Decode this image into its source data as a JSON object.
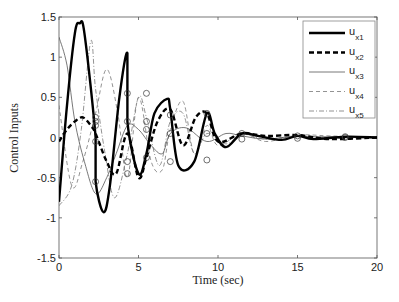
{
  "chart_data": {
    "type": "line",
    "title": "",
    "xlabel": "Time (sec)",
    "ylabel": "Control Inputs",
    "xlim": [
      0,
      20
    ],
    "ylim": [
      -1.5,
      1.5
    ],
    "xticks": [
      0,
      5,
      10,
      15,
      20
    ],
    "yticks": [
      -1.5,
      -1,
      -0.5,
      0,
      0.5,
      1,
      1.5
    ],
    "xtick_labels": [
      "0",
      "5",
      "10",
      "15",
      "20"
    ],
    "ytick_labels": [
      "-1.5",
      "-1",
      "-0.5",
      "0",
      "0.5",
      "1",
      "1.5"
    ],
    "grid": false,
    "legend_position": "upper right",
    "switch_times": [
      2.3,
      4.3,
      5.5,
      7.0,
      9.3,
      11.5,
      15.0,
      18.0
    ],
    "series": [
      {
        "name": "u_x1",
        "label_main": "u",
        "label_sub": "x1",
        "style": "solid-thick",
        "x": [
          0,
          0.5,
          1.0,
          1.3,
          1.6,
          2.3,
          2.3,
          2.8,
          3.2,
          3.8,
          4.3,
          4.3,
          5.0,
          5.5,
          6.0,
          6.8,
          7.0,
          7.5,
          8.5,
          9.3,
          9.8,
          10.5,
          11.5,
          12.5,
          14,
          15,
          16,
          18,
          20
        ],
        "y": [
          -0.8,
          0.4,
          1.3,
          1.42,
          1.3,
          0.0,
          -0.55,
          -0.93,
          -0.6,
          0.5,
          1.05,
          0.2,
          -0.45,
          -0.2,
          0.3,
          0.48,
          0.35,
          -0.35,
          -0.3,
          0.3,
          0.05,
          -0.12,
          0.05,
          0.02,
          -0.03,
          0.02,
          -0.02,
          0.01,
          0.0
        ]
      },
      {
        "name": "u_x2",
        "label_main": "u",
        "label_sub": "x2",
        "style": "dashed-thick",
        "x": [
          0,
          0.5,
          1.0,
          1.5,
          2.0,
          2.3,
          3.0,
          3.6,
          4.3,
          5.0,
          5.5,
          6.2,
          7.0,
          7.8,
          8.6,
          9.3,
          10,
          11.5,
          13,
          15,
          17,
          20
        ],
        "y": [
          -0.05,
          0.1,
          0.2,
          0.25,
          0.15,
          0.05,
          -0.3,
          -0.45,
          0.05,
          -0.5,
          -0.25,
          0.2,
          0.35,
          -0.1,
          0.25,
          0.3,
          -0.05,
          0.05,
          0.02,
          0.03,
          -0.02,
          0.0
        ]
      },
      {
        "name": "u_x3",
        "label_main": "u",
        "label_sub": "x3",
        "style": "solid-thin",
        "x": [
          0,
          0.5,
          1.0,
          1.6,
          2.3,
          3.0,
          3.6,
          4.3,
          5.0,
          5.8,
          6.5,
          7.0,
          8.0,
          9.3,
          10.5,
          11.5,
          13,
          15,
          20
        ],
        "y": [
          1.25,
          0.9,
          0.2,
          -0.3,
          -0.7,
          -0.5,
          -0.2,
          0.15,
          0.1,
          -0.1,
          -0.2,
          0.05,
          0.12,
          -0.05,
          0.05,
          0.02,
          -0.02,
          0.01,
          0.0
        ]
      },
      {
        "name": "u_x4",
        "label_main": "u",
        "label_sub": "x4",
        "style": "dashed-thin",
        "x": [
          0,
          0.8,
          1.5,
          2.3,
          3.0,
          3.7,
          4.3,
          5.0,
          5.8,
          6.5,
          7.0,
          7.8,
          8.5,
          9.3,
          10,
          11.5,
          13,
          15,
          17,
          20
        ],
        "y": [
          0.4,
          -0.6,
          -0.3,
          0.3,
          0.85,
          0.3,
          -0.5,
          0.5,
          -0.3,
          -0.4,
          0.1,
          0.45,
          -0.2,
          0.15,
          -0.1,
          0.05,
          -0.05,
          0.03,
          0.02,
          0.0
        ]
      },
      {
        "name": "u_x5",
        "label_main": "u",
        "label_sub": "x5",
        "style": "dashdot-thin",
        "x": [
          0,
          0.8,
          1.4,
          2.0,
          2.3,
          2.9,
          3.5,
          4.3,
          5.0,
          5.5,
          6.3,
          7.0,
          7.8,
          8.5,
          9.3,
          10.5,
          11.5,
          13,
          15,
          17,
          20
        ],
        "y": [
          -0.85,
          -0.6,
          0.1,
          1.2,
          0.6,
          -0.2,
          -0.75,
          -0.2,
          0.5,
          0.25,
          -0.35,
          0.2,
          0.3,
          -0.2,
          0.05,
          -0.08,
          0.04,
          -0.02,
          0.02,
          -0.01,
          0.0
        ]
      }
    ],
    "markers": {
      "shape": "circle",
      "points": [
        [
          2.3,
          0.25
        ],
        [
          2.3,
          0.2
        ],
        [
          2.3,
          0.15
        ],
        [
          2.3,
          -0.05
        ],
        [
          2.3,
          -0.55
        ],
        [
          4.3,
          0.55
        ],
        [
          4.3,
          0.2
        ],
        [
          4.3,
          -0.3
        ],
        [
          4.3,
          -0.45
        ],
        [
          5.5,
          0.55
        ],
        [
          5.5,
          0.2
        ],
        [
          5.5,
          -0.25
        ],
        [
          5.5,
          0.1
        ],
        [
          7.0,
          0.28
        ],
        [
          7.0,
          -0.3
        ],
        [
          7.0,
          0.05
        ],
        [
          9.3,
          0.3
        ],
        [
          9.3,
          0.05
        ],
        [
          9.3,
          -0.28
        ],
        [
          11.5,
          0.05
        ],
        [
          11.5,
          -0.02
        ],
        [
          15.0,
          0.02
        ],
        [
          15.0,
          -0.01
        ],
        [
          18.0,
          0.01
        ],
        [
          18.0,
          0.0
        ]
      ]
    }
  }
}
